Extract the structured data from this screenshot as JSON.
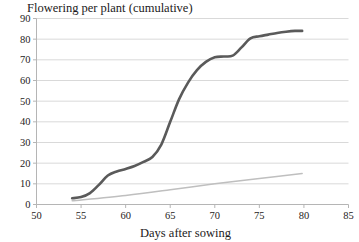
{
  "chart_data": {
    "type": "line",
    "title": "Flowering per plant (cumulative)",
    "xlabel": "Days after sowing",
    "ylabel": "",
    "xlim": [
      50,
      85
    ],
    "ylim": [
      0,
      90
    ],
    "xticks": [
      50,
      55,
      60,
      65,
      70,
      75,
      80,
      85
    ],
    "yticks": [
      0,
      10,
      20,
      30,
      40,
      50,
      60,
      70,
      80,
      90
    ],
    "grid": "horizontal",
    "legend": "none",
    "colors": {
      "cumulative_curve": "#5a5a5a",
      "secondary_line": "#bfbfbf",
      "gridline": "#d9d9d9",
      "axis": "#bfbfbf"
    },
    "series": [
      {
        "name": "cumulative-flowering-curve",
        "style": "thick-dark-sigmoid",
        "color": "#5a5a5a",
        "x": [
          54,
          55,
          56,
          57,
          58,
          59,
          60,
          61,
          62,
          63,
          64,
          65,
          66,
          67,
          68,
          69,
          70,
          71,
          72,
          73,
          74,
          75,
          76,
          77,
          78,
          79,
          79.8
        ],
        "y": [
          3,
          3.6,
          5.5,
          9.5,
          14,
          16,
          17.2,
          18.6,
          20.6,
          23,
          29,
          40,
          51,
          59,
          65,
          69,
          71.2,
          71.6,
          72,
          76,
          80.4,
          81.4,
          82.2,
          83,
          83.6,
          84,
          84
        ]
      },
      {
        "name": "secondary-rate-line",
        "style": "thin-light-linear",
        "color": "#bfbfbf",
        "x": [
          54,
          60,
          65,
          70,
          75,
          79.8
        ],
        "y": [
          1.8,
          4.4,
          7.1,
          10,
          12.6,
          15
        ]
      }
    ]
  },
  "axes": {
    "y_tick_labels": [
      "90",
      "80",
      "70",
      "60",
      "50",
      "40",
      "30",
      "20",
      "10",
      "0"
    ],
    "x_tick_labels": [
      "50",
      "55",
      "60",
      "65",
      "70",
      "75",
      "80",
      "85"
    ]
  }
}
